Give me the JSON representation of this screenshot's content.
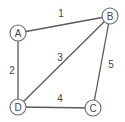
{
  "diagram": {
    "type": "weighted-undirected-graph",
    "colors": {
      "background": "#ffffff",
      "edge": "#5a5a5a",
      "node_stroke": "#6a6a6a",
      "node_fill": "#ffffff",
      "text": "#444444"
    },
    "node_radius": 8,
    "nodes": [
      {
        "id": "A",
        "label": "A",
        "x": 18,
        "y": 33
      },
      {
        "id": "B",
        "label": "B",
        "x": 110,
        "y": 16
      },
      {
        "id": "C",
        "label": "C",
        "x": 93,
        "y": 108
      },
      {
        "id": "D",
        "label": "D",
        "x": 18,
        "y": 107
      }
    ],
    "edges": [
      {
        "from": "A",
        "to": "B",
        "weight": "1",
        "label_x": 61,
        "label_y": 13
      },
      {
        "from": "A",
        "to": "D",
        "weight": "2",
        "label_x": 12,
        "label_y": 70
      },
      {
        "from": "D",
        "to": "B",
        "weight": "3",
        "label_x": 60,
        "label_y": 57
      },
      {
        "from": "D",
        "to": "C",
        "weight": "4",
        "label_x": 60,
        "label_y": 98
      },
      {
        "from": "B",
        "to": "C",
        "weight": "5",
        "label_x": 111,
        "label_y": 64
      }
    ]
  }
}
